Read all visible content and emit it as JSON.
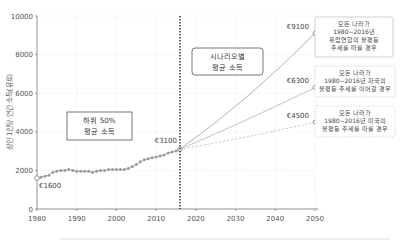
{
  "chart_data": {
    "type": "line",
    "title": "",
    "xlabel": "",
    "ylabel": "성인 1인당 연간 소득(유로)",
    "xlim": [
      1980,
      2050
    ],
    "ylim": [
      0,
      10000
    ],
    "xticks": [
      1980,
      1990,
      2000,
      2010,
      2020,
      2030,
      2040,
      2050
    ],
    "yticks": [
      0,
      2000,
      4000,
      6000,
      8000,
      10000
    ],
    "grid": true,
    "vertical_marker": {
      "x": 2016,
      "style": "dotted"
    },
    "historical": {
      "name": "하위 50% 평균 소득",
      "x": [
        1980,
        1981,
        1982,
        1983,
        1984,
        1985,
        1986,
        1987,
        1988,
        1989,
        1990,
        1991,
        1992,
        1993,
        1994,
        1995,
        1996,
        1997,
        1998,
        1999,
        2000,
        2001,
        2002,
        2003,
        2004,
        2005,
        2006,
        2007,
        2008,
        2009,
        2010,
        2011,
        2012,
        2013,
        2014,
        2015,
        2016
      ],
      "values": [
        1600,
        1650,
        1700,
        1750,
        1900,
        1950,
        2000,
        2000,
        2050,
        2000,
        1950,
        1950,
        1950,
        1950,
        1900,
        1950,
        2000,
        2000,
        2050,
        2050,
        2050,
        2050,
        2050,
        2100,
        2200,
        2300,
        2450,
        2550,
        2600,
        2650,
        2700,
        2750,
        2800,
        2900,
        2950,
        3000,
        3100
      ]
    },
    "scenarios": [
      {
        "name": "모든 나라가 1980~2016년 유럽연합의 불평등 추세를 따를 경우",
        "x": [
          2016,
          2050
        ],
        "values": [
          3100,
          9100
        ],
        "end_label": "€9100",
        "style": "solid-dark"
      },
      {
        "name": "모든 나라가 1980~2016년 자국의 불평등 추세를 이어갈 경우",
        "x": [
          2016,
          2050
        ],
        "values": [
          3100,
          6300
        ],
        "end_label": "€6300",
        "style": "solid-light"
      },
      {
        "name": "모든 나라가 1980~2016년 미국의 불평등 추세를 따를 경우",
        "x": [
          2016,
          2050
        ],
        "values": [
          3100,
          4500
        ],
        "end_label": "€4500",
        "style": "dashed"
      }
    ],
    "annotations": [
      {
        "text": "€1600",
        "x": 1980,
        "y": 1600
      },
      {
        "text": "€3100",
        "x": 2016,
        "y": 3100
      }
    ],
    "legend_boxes": {
      "historical": [
        "하위 50%",
        "평균 소득"
      ],
      "scenario": [
        "시나리오별",
        "평균 소득"
      ]
    },
    "scenario_boxes": [
      [
        "모든 나라가",
        "1980~2016년",
        "유럽연합의 불평등",
        "추세를 따를 경우"
      ],
      [
        "모든 나라가",
        "1980~2016년 자국의",
        "불평등 추세를 이어갈 경우"
      ],
      [
        "모든 나라가",
        "1980~2016년 미국의",
        "불평등 추세를 따를 경우"
      ]
    ]
  }
}
